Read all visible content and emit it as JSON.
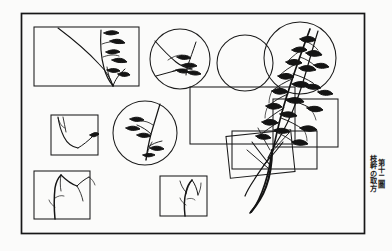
{
  "figure": {
    "title_vertical": "第十二圖",
    "subtitle_vertical": "枝幹の取方",
    "medium": "line-drawing",
    "background_color": "#fbfbfa",
    "ink_color": "#141414",
    "frame": {
      "name": "plate-border",
      "x": 21,
      "y": 13,
      "width": 344,
      "height": 221,
      "stroke_width": 1.6
    },
    "crop_frames": [
      {
        "id": "crop-rect-top-left",
        "shape": "rect",
        "x": 34,
        "y": 27,
        "width": 105,
        "height": 59
      },
      {
        "id": "crop-circle-top",
        "shape": "circle",
        "cx": 180,
        "cy": 59,
        "r": 30
      },
      {
        "id": "crop-circle-mid-right",
        "shape": "circle",
        "cx": 245,
        "cy": 63,
        "r": 28
      },
      {
        "id": "crop-circle-far-right",
        "shape": "circle",
        "cx": 300,
        "cy": 58,
        "r": 36
      },
      {
        "id": "crop-rect-mid-right",
        "shape": "rect",
        "x": 190,
        "y": 87,
        "width": 105,
        "height": 57
      },
      {
        "id": "crop-rect-right-lower",
        "shape": "rect",
        "x": 273,
        "y": 99,
        "width": 65,
        "height": 48
      },
      {
        "id": "crop-rect-center-low",
        "shape": "rect",
        "x": 232,
        "y": 131,
        "width": 85,
        "height": 38
      },
      {
        "id": "crop-rect-tilted",
        "shape": "rect",
        "x": 228,
        "y": 133,
        "width": 65,
        "height": 42,
        "rotation": -6
      },
      {
        "id": "crop-rect-mid-left",
        "shape": "rect",
        "x": 51,
        "y": 115,
        "width": 47,
        "height": 40
      },
      {
        "id": "crop-circle-mid-left",
        "shape": "circle",
        "cx": 145,
        "cy": 133,
        "r": 32
      },
      {
        "id": "crop-rect-bottom-left",
        "shape": "rect",
        "x": 34,
        "y": 171,
        "width": 56,
        "height": 48
      },
      {
        "id": "crop-rect-bottom-mid",
        "shape": "rect",
        "x": 160,
        "y": 176,
        "width": 47,
        "height": 40
      }
    ],
    "crop_frame_count": 12,
    "shape_counts": {
      "rectangles": 8,
      "circles": 4
    }
  }
}
